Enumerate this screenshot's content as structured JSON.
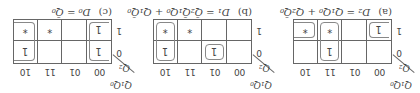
{
  "corner": {
    "col_vars": "Q₁Q₀",
    "row_var": "Q₂"
  },
  "col_labels": [
    "00",
    "01",
    "11",
    "10"
  ],
  "row_labels": [
    "0",
    "1"
  ],
  "maps": [
    {
      "tag": "(a)",
      "equation": "D₂ = Q₁Q₀ + Q₂Q̄₀",
      "cells": [
        [
          "",
          "",
          "1",
          ""
        ],
        [
          "1",
          "",
          "*",
          "*"
        ]
      ]
    },
    {
      "tag": "(b)",
      "equation": "D₁ = Q̄₂Q̄₁Q₀ + Q₁Q̄₀",
      "cells": [
        [
          "",
          "1",
          "",
          "1"
        ],
        [
          "",
          "",
          "*",
          "*"
        ]
      ]
    },
    {
      "tag": "(c)",
      "equation": "D₀ = Q̄₀",
      "cells": [
        [
          "1",
          "",
          "",
          "1"
        ],
        [
          "1",
          "",
          "*",
          "*"
        ]
      ]
    }
  ]
}
